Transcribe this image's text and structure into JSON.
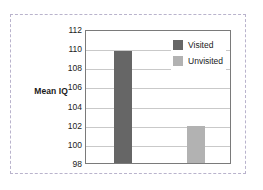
{
  "chart_data": {
    "type": "bar",
    "title": "",
    "subtitle": "",
    "xlabel": "",
    "ylabel": "Mean IQ",
    "ylim": [
      98,
      112
    ],
    "yticks": [
      98,
      100,
      102,
      104,
      106,
      108,
      110,
      112
    ],
    "ytick_labels": [
      "98",
      "100",
      "102",
      "104",
      "106",
      "108",
      "110",
      "112"
    ],
    "grid": true,
    "grid_axis": "y",
    "legend_position": "top-right",
    "categories": [
      "Visited",
      "Unvisited"
    ],
    "series": [
      {
        "name": "Mean IQ",
        "values": [
          109.7,
          101.9
        ]
      }
    ],
    "bars": [
      {
        "label": "Visited",
        "value": 109.7,
        "color": "#666666"
      },
      {
        "label": "Unvisited",
        "value": 101.9,
        "color": "#b2b2b2"
      }
    ],
    "legend": [
      {
        "label": "Visited",
        "color": "#666666"
      },
      {
        "label": "Unvisited",
        "color": "#b2b2b2"
      }
    ],
    "colors": {
      "visited": "#666666",
      "unvisited": "#b2b2b2",
      "gridline": "#c9c9c9",
      "plot_border": "#7a7a7a",
      "outer_dashed_border": "#b9b3cc",
      "background": "#ffffff",
      "text": "#1a1a1a"
    }
  }
}
